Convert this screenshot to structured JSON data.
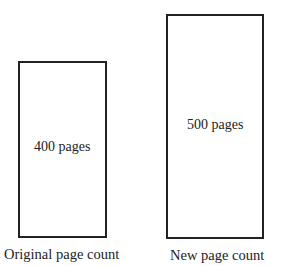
{
  "diagram": {
    "boxes": [
      {
        "label": "400 pages",
        "caption": "Original page count"
      },
      {
        "label": "500 pages",
        "caption": "New page count"
      }
    ]
  }
}
